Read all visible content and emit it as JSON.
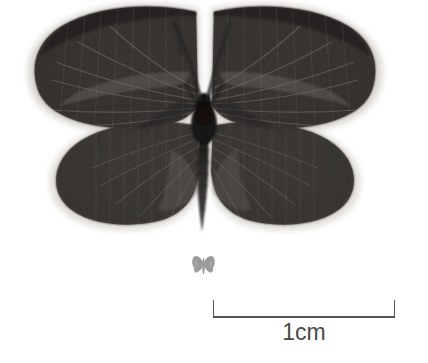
{
  "figure": {
    "kind": "specimen-photograph",
    "background_color": "#ffffff",
    "width_px": 428,
    "height_px": 363
  },
  "specimen": {
    "name": "moth-specimen",
    "view": "dorsal",
    "wing_color_dark": "#2e2c2a",
    "wing_color_mid": "#423f3c",
    "wing_color_light": "#5d5955",
    "fringe_color": "#cfcbc6",
    "body_color": "#1d1c1b",
    "antenna_color": "#262525",
    "parts": [
      "left-forewing",
      "right-forewing",
      "left-hindwing",
      "right-hindwing",
      "thorax",
      "abdomen",
      "left-antenna",
      "right-antenna"
    ]
  },
  "icon": {
    "name": "butterfly-silhouette-icon",
    "color": "#9b9b9b",
    "position": "below-specimen"
  },
  "scale_bar": {
    "name": "scale-bar",
    "label": "1cm",
    "length_px": 182,
    "line_color": "#555555",
    "tick_height_px": 17,
    "value": 1,
    "unit": "cm"
  }
}
